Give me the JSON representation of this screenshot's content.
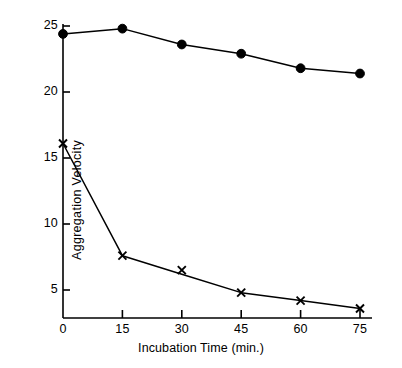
{
  "chart_data": {
    "type": "line",
    "title": "",
    "xlabel": "Incubation Time (min.)",
    "ylabel": "Aggregation Velocity",
    "x": [
      0,
      15,
      30,
      45,
      60,
      75
    ],
    "xticklabels": [
      "0",
      "15",
      "30",
      "45",
      "60",
      "75"
    ],
    "yticks": [
      5,
      10,
      15,
      20,
      25
    ],
    "yticklabels": [
      "5",
      "10",
      "15",
      "20",
      "25"
    ],
    "xlim": [
      0,
      75
    ],
    "ylim": [
      2.8,
      25.6
    ],
    "grid": false,
    "legend": "none",
    "series": [
      {
        "name": "filled-circle-series",
        "marker": "filled-circle",
        "color": "#000000",
        "values": [
          24.4,
          24.8,
          23.6,
          22.9,
          21.8,
          21.4
        ]
      },
      {
        "name": "cross-marker-series",
        "marker": "x-cross",
        "color": "#000000",
        "values": [
          16.1,
          7.6,
          6.2,
          4.8,
          4.2,
          3.6
        ],
        "marker_values": [
          16.1,
          7.6,
          6.5,
          4.8,
          4.2,
          3.6
        ]
      }
    ]
  },
  "axes": {
    "x_title": "Incubation Time (min.)",
    "y_title": "Aggregation Velocity",
    "xticklabels": [
      "0",
      "15",
      "30",
      "45",
      "60",
      "75"
    ],
    "yticklabels": [
      "5",
      "10",
      "15",
      "20",
      "25"
    ]
  }
}
